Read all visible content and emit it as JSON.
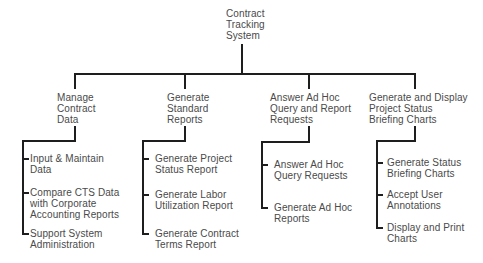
{
  "root": {
    "label": "Contract\nTracking\nSystem"
  },
  "branches": [
    {
      "label": "Manage\nContract\nData",
      "children": [
        "Input & Maintain\nData",
        "Compare CTS Data\nwith Corporate\nAccounting Reports",
        "Support System\nAdministration"
      ]
    },
    {
      "label": "Generate\nStandard\nReports",
      "children": [
        "Generate Project\nStatus Report",
        "Generate Labor\nUtilization Report",
        "Generate Contract\nTerms Report"
      ]
    },
    {
      "label": "Answer Ad Hoc\nQuery and Report\nRequests",
      "children": [
        "Answer Ad Hoc\nQuery Requests",
        "Generate Ad Hoc\nReports"
      ]
    },
    {
      "label": "Generate and Display\nProject Status\nBriefing Charts",
      "children": [
        "Generate Status\nBriefing Charts",
        "Accept User\nAnnotations",
        "Display and Print\nCharts"
      ]
    }
  ]
}
